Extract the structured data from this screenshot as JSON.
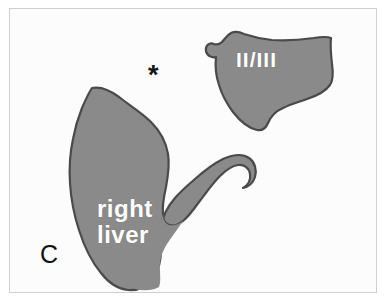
{
  "figure": {
    "panel_letter": "C",
    "background_color": "#fcfcfc",
    "border_color": "#cfcfcf",
    "width": 388,
    "height": 303
  },
  "markers": {
    "asterisk": "*",
    "asterisk_color": "#141414"
  },
  "regions": [
    {
      "id": "segment-ii-iii",
      "label": "II/III",
      "label_color": "#ffffff",
      "fill_color": "#8a8a8a",
      "stroke_color": "#4a4a4a"
    },
    {
      "id": "right-liver",
      "label": "right\nliver",
      "label_line_1": "right",
      "label_line_2": "liver",
      "label_color": "#ffffff",
      "fill_color": "#8a8a8a",
      "stroke_color": "#4a4a4a"
    }
  ]
}
